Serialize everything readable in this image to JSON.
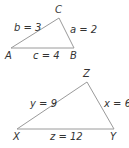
{
  "triangles": [
    {
      "vertices": [
        {
          "name": "A",
          "x": 11,
          "y": 48,
          "lx": 5,
          "ly": 59
        },
        {
          "name": "B",
          "x": 74,
          "y": 48,
          "lx": 70,
          "ly": 59
        },
        {
          "name": "C",
          "x": 59,
          "y": 18,
          "lx": 55,
          "ly": 13
        }
      ],
      "sides": [
        {
          "label": "b = 3",
          "lx": 14,
          "ly": 31
        },
        {
          "label": "a = 2",
          "lx": 70,
          "ly": 33
        },
        {
          "label": "c = 4",
          "lx": 33,
          "ly": 59
        }
      ]
    },
    {
      "vertices": [
        {
          "name": "X",
          "x": 17,
          "y": 129,
          "lx": 13,
          "ly": 140
        },
        {
          "name": "Y",
          "x": 114,
          "y": 129,
          "lx": 110,
          "ly": 140
        },
        {
          "name": "Z",
          "x": 87,
          "y": 82,
          "lx": 83,
          "ly": 77
        }
      ],
      "sides": [
        {
          "label": "y = 9",
          "lx": 30,
          "ly": 107
        },
        {
          "label": "x = 6",
          "lx": 104,
          "ly": 107
        },
        {
          "label": "z = 12",
          "lx": 50,
          "ly": 140
        }
      ]
    }
  ],
  "colors": {
    "line": "#9a9a9a",
    "text": "#333333"
  }
}
